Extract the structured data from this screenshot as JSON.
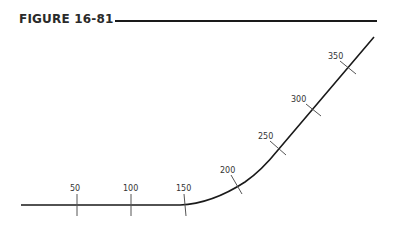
{
  "figure": {
    "title": "FIGURE 16-81"
  },
  "stations": [
    {
      "label": "50"
    },
    {
      "label": "100"
    },
    {
      "label": "150"
    },
    {
      "label": "200"
    },
    {
      "label": "250"
    },
    {
      "label": "300"
    },
    {
      "label": "350"
    }
  ]
}
